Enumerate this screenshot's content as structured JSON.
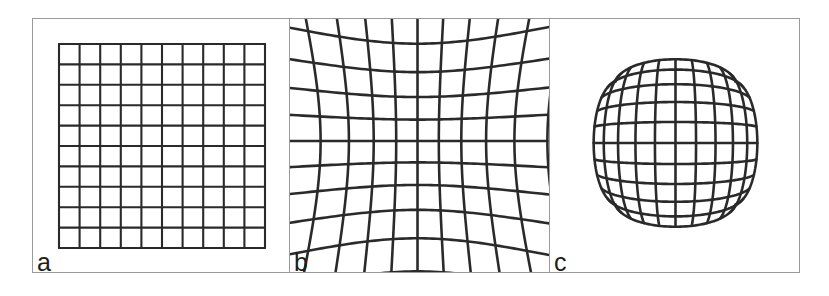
{
  "figure": {
    "background_color": "#ffffff",
    "frame_color": "#9a9a9a",
    "grid_color": "#2a2a2a",
    "label_color": "#1d1d1d",
    "width": 829,
    "height": 296
  },
  "chart_data": {
    "type": "diagram",
    "subtitle": "",
    "xlabel": "",
    "ylabel": "",
    "grid": true,
    "legend_position": "none",
    "panels": [
      {
        "label": "a",
        "name": "no-distortion",
        "description": "Undistorted regular square grid",
        "rows": 10,
        "cols": 10,
        "distortion_type": "none",
        "k": 0.0,
        "line_width": 2.1,
        "box": {
          "x": 26,
          "y": 25,
          "w": 206,
          "h": 204
        },
        "panel_width": 256
      },
      {
        "label": "b",
        "name": "barrel-distortion",
        "description": "Barrel distortion, grid bulges outward",
        "rows": 10,
        "cols": 10,
        "distortion_type": "barrel",
        "k": 0.115,
        "line_width": 2.6,
        "box": {
          "x": 22,
          "y": 16,
          "w": 212,
          "h": 212
        },
        "panel_width": 260
      },
      {
        "label": "c",
        "name": "pincushion-distortion",
        "description": "Pincushion distortion, grid pinches inward",
        "rows": 10,
        "cols": 10,
        "distortion_type": "pincushion",
        "k": -0.105,
        "line_width": 2.6,
        "box": {
          "x": 22,
          "y": 18,
          "w": 208,
          "h": 212
        },
        "panel_width": 250
      }
    ],
    "axis_ranges": {
      "x": [
        -1,
        1
      ],
      "y": [
        -1,
        1
      ]
    }
  }
}
